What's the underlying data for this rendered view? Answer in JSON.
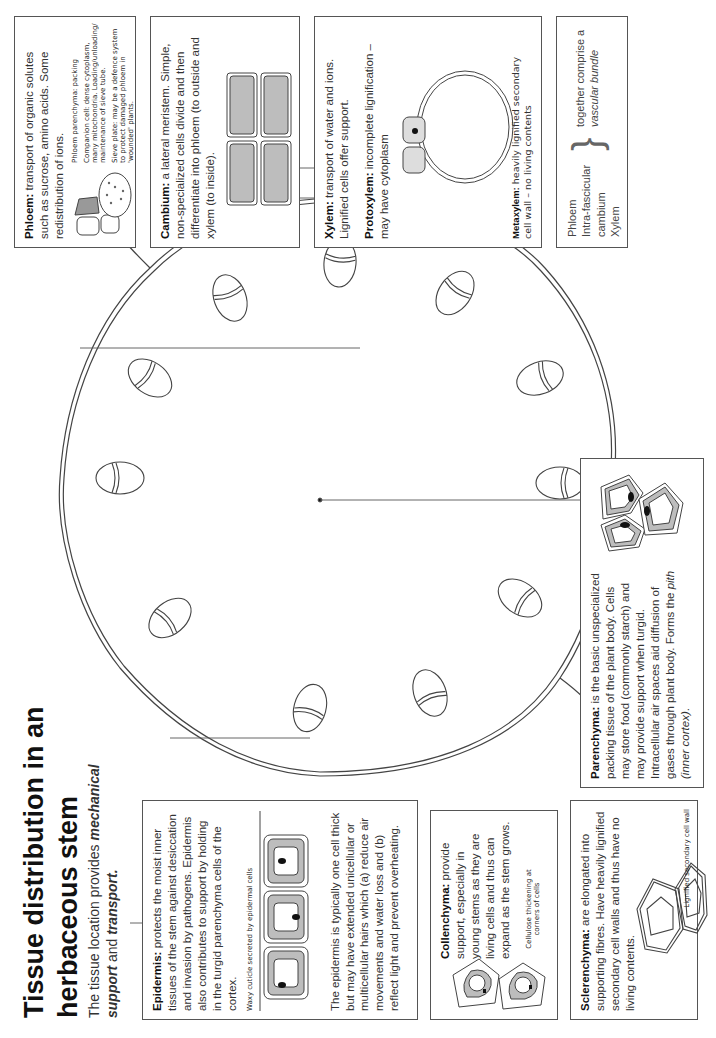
{
  "title": "Tissue distribution in an herbaceous stem",
  "title_line1": "Tissue distribution in an",
  "title_line2": "herbaceous stem",
  "subtitle": {
    "pre": "The tissue location provides ",
    "em1": "mechanical support",
    "mid": " and ",
    "em2": "transport."
  },
  "epidermis": {
    "heading": "Epidermis:",
    "text": " protects the moist inner tissues of the stem against desiccation and invasion by pathogens. Epidermis also contributes to support by holding in the turgid parenchyma cells of the cortex.",
    "caption": "Waxy cuticle secreted by epidermal cells",
    "text2": "The epidermis is typically one cell thick but may have extended unicellular or multicellular hairs which (a) reduce air movements and water loss and (b) reflect light and prevent overheating."
  },
  "collenchyma": {
    "heading": "Collenchyma:",
    "text": " provide support, especially in young stems as they are living cells and thus can expand as the stem grows.",
    "caption": "Cellulose thickening at corners of cells"
  },
  "sclerenchyma": {
    "heading": "Sclerenchyma:",
    "text": " are elongated into supporting fibres. Have heavily lignified secondary cell walls and thus have no living contents.",
    "caption": "Lignified secondary cell wall"
  },
  "parenchyma": {
    "heading": "Parenchyma:",
    "text": " is the basic unspecialized packing tissue of the plant body. Cells may store food (commonly starch) and may provide support when turgid. Intracellular air spaces aid diffusion of gases through plant body. Forms the ",
    "em": "pith (inner cortex)",
    "end": "."
  },
  "phloem": {
    "heading": "Phloem:",
    "text": " transport of organic solutes such as sucrose, amino acids. Some redistribution of ions.",
    "labels": [
      "Phloem parenchyma: packing",
      "Companion cell: dense cytoplasm, many mitochondria. Loading/unloading/ maintenance of sieve tube.",
      "Sieve plate: may be a defence system to protect damaged phloem in 'wounded' plants."
    ]
  },
  "cambium": {
    "heading": "Cambium:",
    "text": " a lateral meristem. Simple, non-specialized cells divide and then differentiate into phloem (to outside and xylem (to inside)."
  },
  "xylem": {
    "heading": "Xylem:",
    "text": " transport of water and ions. Lignified cells offer support.",
    "protoxylem_heading": "Protoxylem:",
    "protoxylem_text": " incomplete lignification – may have cytoplasm",
    "metaxylem_heading": "Metaxylem:",
    "metaxylem_text": " heavily lignified secondary cell wall – no living contents"
  },
  "vascular_bundle_summary": {
    "items": [
      "Phloem",
      "Intra-fascicular",
      "cambium",
      "Xylem"
    ],
    "text": "together comprise a",
    "em": "vascular bundle"
  },
  "colors": {
    "line": "#444444",
    "cell_fill": "#bdbdbd",
    "nucleus": "#111111",
    "box_border": "#555555"
  }
}
